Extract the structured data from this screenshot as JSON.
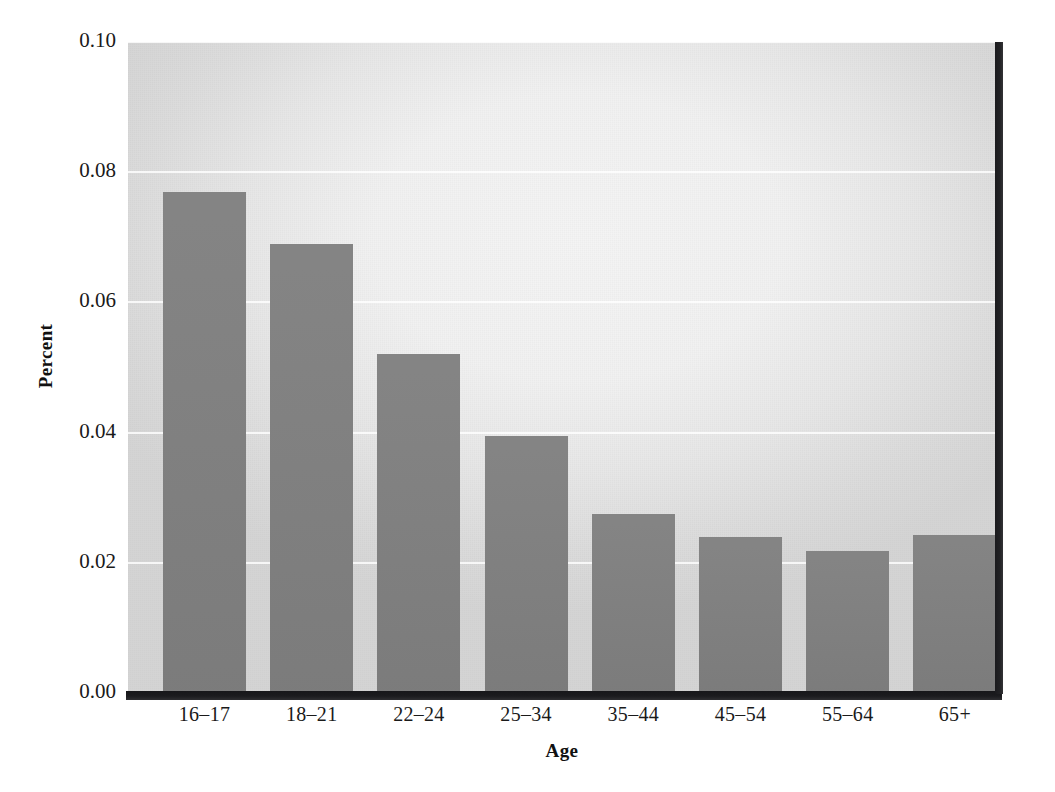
{
  "chart_data": {
    "type": "bar",
    "title": "",
    "subtitle": "",
    "xlabel": "Age",
    "ylabel": "Percent",
    "categories": [
      "16–17",
      "18–21",
      "22–24",
      "25–34",
      "35–44",
      "45–54",
      "55–64",
      "65+"
    ],
    "values": [
      0.077,
      0.069,
      0.052,
      0.0395,
      0.0275,
      0.024,
      0.0218,
      0.0242
    ],
    "ylim": [
      0.0,
      0.1
    ],
    "ytick_labels": [
      "0.00",
      "0.02",
      "0.04",
      "0.06",
      "0.08",
      "0.10"
    ],
    "ytick_values": [
      0.0,
      0.02,
      0.04,
      0.06,
      0.08,
      0.1
    ],
    "grid": true,
    "grid_axis": "y",
    "legend": "none",
    "bar_color": "#808080",
    "plot_background": "#ededed",
    "axis_color": "#1a1a1a",
    "gridline_color": "#ffffff"
  }
}
